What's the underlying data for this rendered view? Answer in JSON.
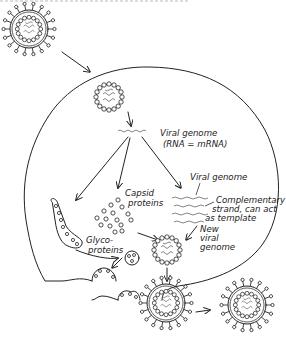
{
  "figure": {
    "title_cropped": "",
    "labels": {
      "viral_genome_1": "Viral genome",
      "viral_genome_1b": "(RNA = mRNA)",
      "capsid_1": "Capsid",
      "capsid_2": "proteins",
      "viral_genome_2": "Viral genome",
      "complementary_1": "Complementary",
      "complementary_2": "strand, can act",
      "complementary_3": "as template",
      "new_1": "New",
      "new_2": "viral",
      "new_3": "genome",
      "glyco_1": "Glyco-",
      "glyco_2": "proteins"
    },
    "stages": [
      "enveloped virus outside cell",
      "nucleocapsid inside cell",
      "viral genome (RNA = mRNA)",
      "capsid proteins",
      "glycoproteins in ER",
      "complementary strand template",
      "new viral genome",
      "assembled nucleocapsid",
      "budding at membrane",
      "released virion"
    ],
    "colors": {
      "ink": "#222222",
      "genome": "#777777",
      "background": "#ffffff"
    }
  }
}
